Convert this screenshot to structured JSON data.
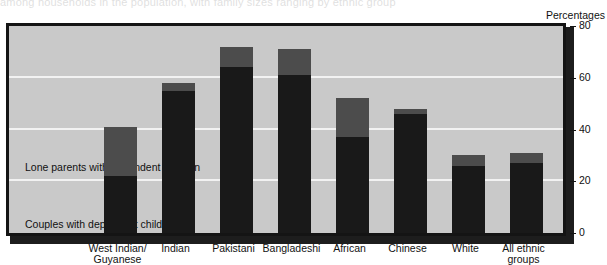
{
  "page": {
    "bleed_text": "among households in the population, with family sizes ranging by ethnic group",
    "unit_label": "Percentages"
  },
  "legend": {
    "lone_line1": "Lone parents with",
    "lone_line2": "dependent children",
    "couple_line1": "Couples with",
    "couple_line2": "dependent children"
  },
  "colors": {
    "lone_parents": "#4c4c4c",
    "couples": "#191919",
    "plot_background": "#c9c9c9",
    "gridline": "#f2f2f2",
    "frame": "#141414"
  },
  "chart_data": {
    "type": "bar",
    "stacked": true,
    "title": "",
    "subtitle": "",
    "xlabel": "",
    "ylabel": "Percentages",
    "ylim": [
      0,
      80
    ],
    "yticks": [
      0,
      20,
      40,
      60,
      80
    ],
    "grid": true,
    "legend_position": "inside-left",
    "categories": [
      "West Indian/\nGuyanese",
      "Indian",
      "Pakistani",
      "Bangladeshi",
      "African",
      "Chinese",
      "White",
      "All ethnic\ngroups"
    ],
    "category_lines": [
      [
        "West Indian/",
        "Guyanese"
      ],
      [
        "Indian",
        ""
      ],
      [
        "Pakistani",
        ""
      ],
      [
        "Bangladeshi",
        ""
      ],
      [
        "African",
        ""
      ],
      [
        "Chinese",
        ""
      ],
      [
        "White",
        ""
      ],
      [
        "All ethnic",
        "groups"
      ]
    ],
    "series": [
      {
        "name": "Couples with dependent children",
        "color": "#191919",
        "values": [
          22,
          55,
          64,
          61,
          37,
          46,
          26,
          27
        ]
      },
      {
        "name": "Lone parents with dependent children",
        "color": "#4c4c4c",
        "values": [
          19,
          3,
          8,
          10,
          15,
          2,
          4,
          4
        ]
      }
    ],
    "totals": [
      41,
      58,
      72,
      71,
      52,
      48,
      30,
      31
    ]
  }
}
